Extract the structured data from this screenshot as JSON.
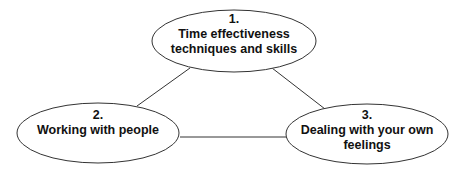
{
  "diagram": {
    "nodes": [
      {
        "number": "1.",
        "line1": "Time effectiveness",
        "line2": "techniques and skills"
      },
      {
        "number": "2.",
        "line1": "Working with people",
        "line2": ""
      },
      {
        "number": "3.",
        "line1": "Dealing with your own",
        "line2": "feelings"
      }
    ],
    "edges": [
      {
        "from": "1",
        "to": "2"
      },
      {
        "from": "1",
        "to": "3"
      },
      {
        "from": "2",
        "to": "3"
      }
    ],
    "stroke_color": "#333333"
  }
}
